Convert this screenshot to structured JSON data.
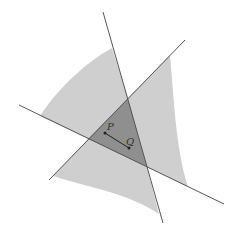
{
  "diagram": {
    "colors": {
      "background": "#ffffff",
      "light_region": "#cfcfcf",
      "dark_region": "#8f8f8f",
      "line": "#555555",
      "point": "#222222"
    },
    "lines": [
      {
        "name": "line-a",
        "x1": 103,
        "y1": 12,
        "x2": 163,
        "y2": 223
      },
      {
        "name": "line-b",
        "x1": 185,
        "y1": 40,
        "x2": 49,
        "y2": 180
      },
      {
        "name": "line-c",
        "x1": 19,
        "y1": 105,
        "x2": 224,
        "y2": 204
      }
    ],
    "triangle": [
      [
        128,
        98
      ],
      [
        88,
        139
      ],
      [
        147,
        167
      ]
    ],
    "points": {
      "P": {
        "label": "P",
        "x": 105,
        "y": 133,
        "label_x": 107,
        "label_y": 130
      },
      "Q": {
        "label": "Q",
        "x": 129,
        "y": 148,
        "label_x": 126,
        "label_y": 145
      }
    }
  }
}
